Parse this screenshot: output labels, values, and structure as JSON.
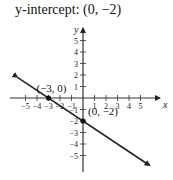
{
  "title": "y-intercept: (0, −2)",
  "chart_data": {
    "type": "line",
    "title": "y-intercept: (0, −2)",
    "xlabel": "x",
    "ylabel": "y",
    "xlim": [
      -6,
      6
    ],
    "ylim": [
      -6,
      6
    ],
    "x_ticks": [
      -5,
      -4,
      -3,
      -2,
      -1,
      1,
      2,
      3,
      4,
      5
    ],
    "y_ticks": [
      -5,
      -4,
      -3,
      -2,
      -1,
      1,
      2,
      3,
      4,
      5
    ],
    "x_tick_labels": [
      "−5",
      "−4",
      "−3",
      "−2",
      "−1",
      "1",
      "2",
      "3",
      "4",
      "5"
    ],
    "y_tick_labels": [
      "−5",
      "−4",
      "−3",
      "−2",
      "−1",
      "1",
      "2",
      "3",
      "4",
      "5"
    ],
    "grid": false,
    "series": [
      {
        "name": "line",
        "equation": "y = -2/3 x - 2",
        "x": [
          -6,
          6
        ],
        "y": [
          2,
          -6
        ],
        "color": "#222222",
        "arrows": "both"
      }
    ],
    "points": [
      {
        "x": -3,
        "y": 0,
        "label": "(−3, 0)"
      },
      {
        "x": 0,
        "y": -2,
        "label": "(0, −2)"
      }
    ]
  },
  "colors": {
    "axis": "#333333",
    "line": "#222222",
    "text": "#111111"
  }
}
